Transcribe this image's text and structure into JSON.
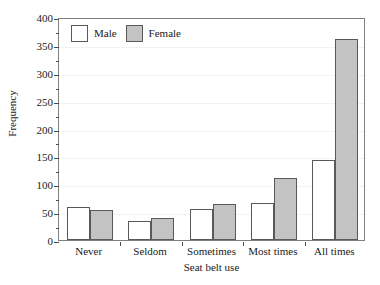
{
  "chart_data": {
    "type": "bar",
    "title": "",
    "xlabel": "Seat belt use",
    "ylabel": "Frequency",
    "categories": [
      "Never",
      "Seldom",
      "Sometimes",
      "Most times",
      "All times"
    ],
    "series": [
      {
        "name": "Male",
        "values": [
          60,
          34,
          55,
          67,
          143
        ],
        "color": "#ffffff"
      },
      {
        "name": "Female",
        "values": [
          54,
          40,
          65,
          111,
          360
        ],
        "color": "#c3c3c3"
      }
    ],
    "ylim": [
      0,
      400
    ],
    "y_tick_labels": [
      "0",
      "50",
      "100",
      "150",
      "200",
      "250",
      "300",
      "350",
      "400"
    ],
    "y_tick_values": [
      0,
      50,
      100,
      150,
      200,
      250,
      300,
      350,
      400
    ],
    "y_minor_tick_values": [
      25,
      75,
      125,
      175,
      225,
      275,
      325,
      375
    ],
    "grid": false,
    "legend_position": "top-left",
    "legend": [
      {
        "label": "Male",
        "swatch": "white-square"
      },
      {
        "label": "Female",
        "swatch": "gray-square"
      }
    ]
  }
}
